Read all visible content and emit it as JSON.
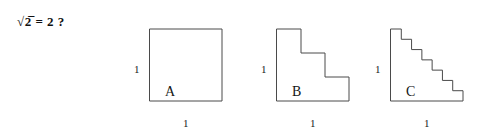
{
  "formula": {
    "text": "√2̅ = 2 ?",
    "radicand": "2",
    "equals_value": "2",
    "question_mark": "?"
  },
  "figures": [
    {
      "id": "A",
      "label": "A",
      "steps": 1,
      "left_label": "1",
      "bottom_label": "1",
      "origin_x": 150,
      "origin_y": 29,
      "size": 72,
      "letter_x": 165,
      "letter_y": 85,
      "left_label_x": 134,
      "left_label_y": 64,
      "bottom_label_x": 183,
      "bottom_label_y": 118
    },
    {
      "id": "B",
      "label": "B",
      "steps": 3,
      "left_label": "1",
      "bottom_label": "1",
      "origin_x": 277,
      "origin_y": 29,
      "size": 72,
      "letter_x": 292,
      "letter_y": 85,
      "left_label_x": 261,
      "left_label_y": 64,
      "bottom_label_x": 310,
      "bottom_label_y": 118
    },
    {
      "id": "C",
      "label": "C",
      "steps": 7,
      "left_label": "1",
      "bottom_label": "1",
      "origin_x": 391,
      "origin_y": 29,
      "size": 72,
      "letter_x": 406,
      "letter_y": 85,
      "left_label_x": 375,
      "left_label_y": 64,
      "bottom_label_x": 424,
      "bottom_label_y": 118
    }
  ],
  "colors": {
    "stroke": "#4a4a4a",
    "fill": "#ffffff",
    "text": "#1a1a1a",
    "background": "#ffffff"
  }
}
